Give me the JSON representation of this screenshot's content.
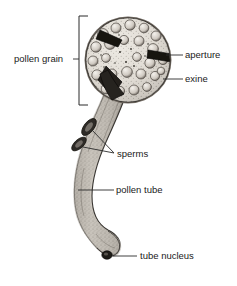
{
  "figure": {
    "background_color": "#ffffff",
    "ink_color": "#2b2b2b",
    "width": 237,
    "height": 286
  },
  "labels": {
    "pollen_grain": "pollen grain",
    "aperture": "aperture",
    "exine": "exine",
    "sperms": "sperms",
    "pollen_tube": "pollen tube",
    "tube_nucleus": "tube nucleus"
  },
  "structures": {
    "grain": {
      "name": "pollen grain body",
      "center_x": 128,
      "center_y": 60,
      "radius": 42,
      "surface": "spiny reticulate exine with rounded lacunae"
    },
    "tube": {
      "name": "pollen tube",
      "shape": "S-curve descending from grain to lower left",
      "fill_color": "#b9b4ac"
    },
    "sperm_cells": [
      {
        "x": 88,
        "y": 127
      },
      {
        "x": 79,
        "y": 143
      }
    ],
    "tube_nucleus_cell": {
      "x": 107,
      "y": 256
    },
    "apertures": [
      {
        "name": "upper-left aperture slit"
      },
      {
        "name": "right aperture slit"
      },
      {
        "name": "lower tube aperture"
      }
    ]
  }
}
